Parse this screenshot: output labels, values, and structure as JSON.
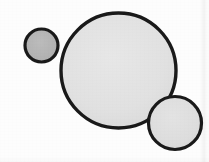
{
  "figure": {
    "background_color": "#fdfdfd",
    "canvas": {
      "width": 209,
      "height": 162
    },
    "stroke_color": "#1a1a1a",
    "medium_label": "",
    "caption": ""
  },
  "chart_data": {
    "type": "scatter",
    "subtitle": "",
    "xlabel": "",
    "ylabel": "",
    "xlim": [
      0,
      209
    ],
    "ylim": [
      0,
      162
    ],
    "grid": false,
    "legend_position": "none",
    "annotations": [],
    "series": [
      {
        "name": "circles",
        "marker": "circle",
        "points": [
          {
            "id": "small-circle",
            "label": "small circle",
            "cx": 41.5,
            "cy": 45.5,
            "r": 16.5,
            "diameter": 33,
            "fill": "#b2b2b2",
            "stroke": "#1a1a1a",
            "stroke_width": 3.2
          },
          {
            "id": "large-circle",
            "label": "large circle",
            "cx": 118.5,
            "cy": 70.5,
            "r": 57.5,
            "diameter": 115,
            "fill": "#e2e2e2",
            "stroke": "#1a1a1a",
            "stroke_width": 3.4
          },
          {
            "id": "medium-circle",
            "label": "medium circle",
            "cx": 175,
            "cy": 123,
            "r": 26.5,
            "diameter": 53,
            "fill": "#dedede",
            "stroke": "#1a1a1a",
            "stroke_width": 3.2
          }
        ]
      }
    ]
  }
}
